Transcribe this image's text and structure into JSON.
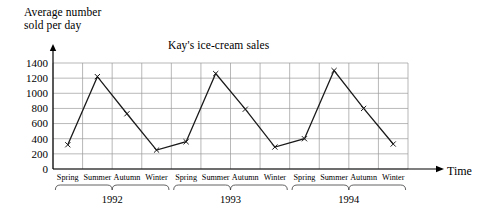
{
  "chart_data": {
    "type": "line",
    "title": "Kay's ice-cream sales",
    "xlabel": "Time",
    "ylabel": "Average number\nsold per day",
    "categories": [
      "Spring",
      "Summer",
      "Autumn",
      "Winter",
      "Spring",
      "Summer",
      "Autumn",
      "Winter",
      "Spring",
      "Summer",
      "Autumn",
      "Winter"
    ],
    "groups": [
      {
        "label": "1992",
        "seasons": [
          "Spring",
          "Summer",
          "Autumn",
          "Winter"
        ],
        "values": [
          320,
          1220,
          730,
          250
        ]
      },
      {
        "label": "1993",
        "seasons": [
          "Spring",
          "Summer",
          "Autumn",
          "Winter"
        ],
        "values": [
          360,
          1260,
          790,
          290
        ]
      },
      {
        "label": "1994",
        "seasons": [
          "Spring",
          "Summer",
          "Autumn",
          "Winter"
        ],
        "values": [
          400,
          1300,
          800,
          330
        ]
      }
    ],
    "values": [
      320,
      1220,
      730,
      250,
      360,
      1260,
      790,
      290,
      400,
      1300,
      800,
      330
    ],
    "yticks": [
      0,
      200,
      400,
      600,
      800,
      1000,
      1200,
      1400
    ],
    "ylim": [
      0,
      1400
    ],
    "grid": true,
    "legend": "none",
    "marker": "x",
    "line_color": "#1a1a1a",
    "grid_color": "#9a9a9a",
    "axis_color": "#000000"
  },
  "axis": {
    "y_caption": "Average number\nsold per day",
    "x_caption": "Time"
  },
  "title": "Kay's ice-cream sales"
}
